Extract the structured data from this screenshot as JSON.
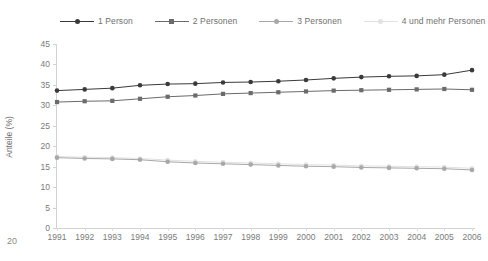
{
  "page": {
    "number": "20"
  },
  "chart_data": {
    "type": "line",
    "title": "",
    "xlabel": "",
    "ylabel": "Anteile (%)",
    "ylim": [
      0,
      45
    ],
    "yticks": [
      0,
      5,
      10,
      15,
      20,
      25,
      30,
      35,
      40,
      45
    ],
    "grid": false,
    "legend_position": "top",
    "categories": [
      "1991",
      "1992",
      "1993",
      "1994",
      "1995",
      "1996",
      "1997",
      "1998",
      "1999",
      "2000",
      "2001",
      "2002",
      "2003",
      "2004",
      "2005",
      "2006"
    ],
    "series": [
      {
        "name": "1 Person",
        "color": "#3a3a3a",
        "marker": "circle",
        "values": [
          33.6,
          33.9,
          34.2,
          34.9,
          35.2,
          35.3,
          35.6,
          35.7,
          35.9,
          36.2,
          36.6,
          36.9,
          37.1,
          37.2,
          37.5,
          38.6
        ]
      },
      {
        "name": "2 Personen",
        "color": "#6b6b6b",
        "marker": "square",
        "values": [
          30.8,
          31.0,
          31.1,
          31.6,
          32.1,
          32.4,
          32.8,
          33.0,
          33.2,
          33.4,
          33.6,
          33.7,
          33.8,
          33.9,
          34.0,
          33.8
        ]
      },
      {
        "name": "3 Personen",
        "color": "#a8a8a8",
        "marker": "circle",
        "values": [
          17.2,
          17.0,
          16.9,
          16.7,
          16.2,
          15.9,
          15.7,
          15.5,
          15.3,
          15.1,
          15.0,
          14.8,
          14.7,
          14.6,
          14.5,
          14.2
        ]
      },
      {
        "name": "4 und mehr Personen",
        "color": "#e2e2e2",
        "marker": "circle",
        "values": [
          17.5,
          17.3,
          17.2,
          17.0,
          16.6,
          16.3,
          16.1,
          15.9,
          15.7,
          15.5,
          15.4,
          15.2,
          15.1,
          15.0,
          14.9,
          14.6
        ]
      }
    ]
  }
}
